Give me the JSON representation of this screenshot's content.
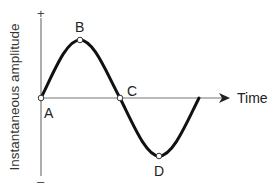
{
  "diagram": {
    "y_axis_label": "Instantaneous amplitude",
    "x_axis_label": "Time",
    "y_positive_sign": "+",
    "y_negative_sign": "–",
    "points": [
      {
        "id": "A",
        "label": "A",
        "description": "start, zero crossing"
      },
      {
        "id": "B",
        "label": "B",
        "description": "positive peak"
      },
      {
        "id": "C",
        "label": "C",
        "description": "zero crossing"
      },
      {
        "id": "D",
        "label": "D",
        "description": "negative peak"
      }
    ],
    "colors": {
      "curve": "#111111",
      "axes": "#777777",
      "point_fill": "#ffffff",
      "text": "#222222"
    }
  }
}
